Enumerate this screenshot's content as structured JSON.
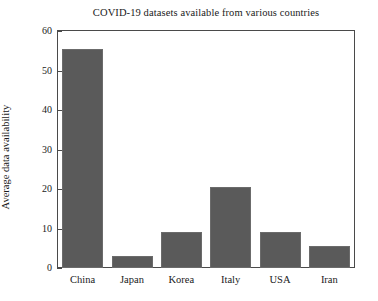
{
  "chart_data": {
    "type": "bar",
    "title": "COVID-19 datasets available from various countries",
    "xlabel": "",
    "ylabel": "Average data availability",
    "categories": [
      "China",
      "Japan",
      "Korea",
      "Italy",
      "USA",
      "Iran"
    ],
    "values": [
      55.4,
      3.0,
      9.1,
      20.4,
      9.2,
      5.5
    ],
    "ylim": [
      0,
      60
    ],
    "yticks": [
      0,
      10,
      20,
      30,
      40,
      50,
      60
    ],
    "ytick_labels": [
      "0",
      "10",
      "20",
      "30",
      "40",
      "50",
      "60"
    ],
    "grid": false,
    "legend": false,
    "bar_color": "#5a5a5a",
    "axis_color": "#4a4a4a",
    "background_color": "#ffffff"
  }
}
